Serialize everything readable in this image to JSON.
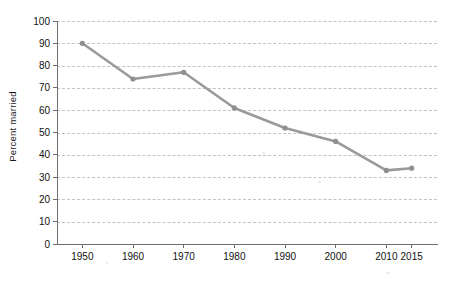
{
  "chart_data": {
    "type": "line",
    "title": "",
    "subtitle": "",
    "xlabel": "",
    "ylabel": "Percent married",
    "x": [
      1950,
      1960,
      1970,
      1980,
      1990,
      2000,
      2010,
      2015
    ],
    "xtick_labels": [
      "1950",
      "1960",
      "1970",
      "1980",
      "1990",
      "2000",
      "2010",
      "2015"
    ],
    "values": [
      90,
      74,
      77,
      61,
      52,
      46,
      33,
      34
    ],
    "series": [
      {
        "name": "Percent married",
        "values": [
          90,
          74,
          77,
          61,
          52,
          46,
          33,
          34
        ]
      }
    ],
    "ylim": [
      0,
      100
    ],
    "ytick_labels": [
      "0",
      "10",
      "20",
      "30",
      "40",
      "50",
      "60",
      "70",
      "80",
      "90",
      "100"
    ],
    "ytick_values": [
      0,
      10,
      20,
      30,
      40,
      50,
      60,
      70,
      80,
      90,
      100
    ],
    "grid": true,
    "grid_axis": "y",
    "grid_style": "dashed",
    "legend": false,
    "legend_position": "none",
    "line_color": "#9a9a9a",
    "marker_color": "#8f8f8f",
    "marker": "circle",
    "axis_color": "#6e6e6e",
    "grid_color": "#c3c3c3",
    "background_color": "#ffffff",
    "text_color": "#111111"
  }
}
